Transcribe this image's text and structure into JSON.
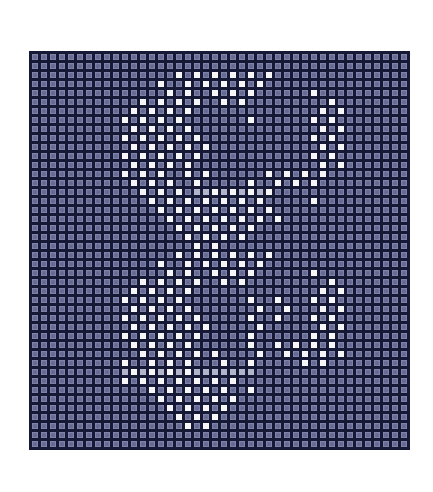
{
  "grid": {
    "cols": 42,
    "rows": 44,
    "cell_px": 8,
    "gap_px": 1,
    "colors": {
      "page_bg": "#ffffff",
      "line": "#161936",
      "base_cell": "#7276a0",
      "white_cell": "#f5f5f7",
      "smear_cell": "#b2b4ca"
    },
    "legend": {
      ".": "base-cell",
      "W": "white-cell",
      "S": "smear-cell"
    },
    "pattern": [
      "..........................................",
      "..........................................",
      "................W.W.W.W.W.W...............",
      "..............W..W.W.W.W.W................",
      "...............W.W..W.W.W......W..........",
      "............W.W.W.W..W.W.........W........",
      "...........W.W.W.W..............W.W.......",
      "..........W.W.W.W.......W......W.W........",
      "...........W.W.W.W..............W.W.......",
      "..........W.W.W.W.W............W.W........",
      "...........W.W.W.W.W............W.W.......",
      "..........W.W.W.W.W............W.W........",
      "...........W.W.W.W..............W.W.......",
      "..........W.W.W..W.W......W.W.W.W.........",
      "...........W.W.W..W.....W..W.W.W..........",
      "............W.W.W.SSWSWSWSW...............",
      ".............W.W.W.W.W.W.W.....W..........",
      "..............W.W.W.W.W.W.W...............",
      "...............W.W.W.W.W.W.W..............",
      "................W.W.W.W.W.................",
      ".................W.W.W.W..................",
      "..................W.W.....................",
      "................W.W.W.W.W.W...............",
      "..............W..W.W.W.W.W................",
      "...............W.W..W.W.W......W..........",
      "............W.W.W.W..W.W.........W........",
      "...........W.W.W.W..............W.W.......",
      "..........W.W.W.W.......W..W...W.W........",
      "...........W.W.W.W.......W..W...W.W.......",
      "..........W.W.W.W.W.....W..W...W.W........",
      "...........W.W.W.W.W.....W......W.W.......",
      "..........W.W.W.W.W.....W......W.W........",
      "...........W.W.W.W......W..W.W.W.W........",
      "............W.W.W.W.W....W..W.W.W.W.......",
      "..........W..W.W.W...W..W.....W.W.........",
      "..........SWSWSWSWSSSSSSS.................",
      "..........W.W.W.W.W.W.W...................",
      ".............W.W.W.W.W..W.................",
      "..............W.W.W.W.W...................",
      "...............W.W.W.W....................",
      "................W.W.W.....................",
      ".................W.W......................",
      "..........................................",
      ".........................................."
    ]
  }
}
